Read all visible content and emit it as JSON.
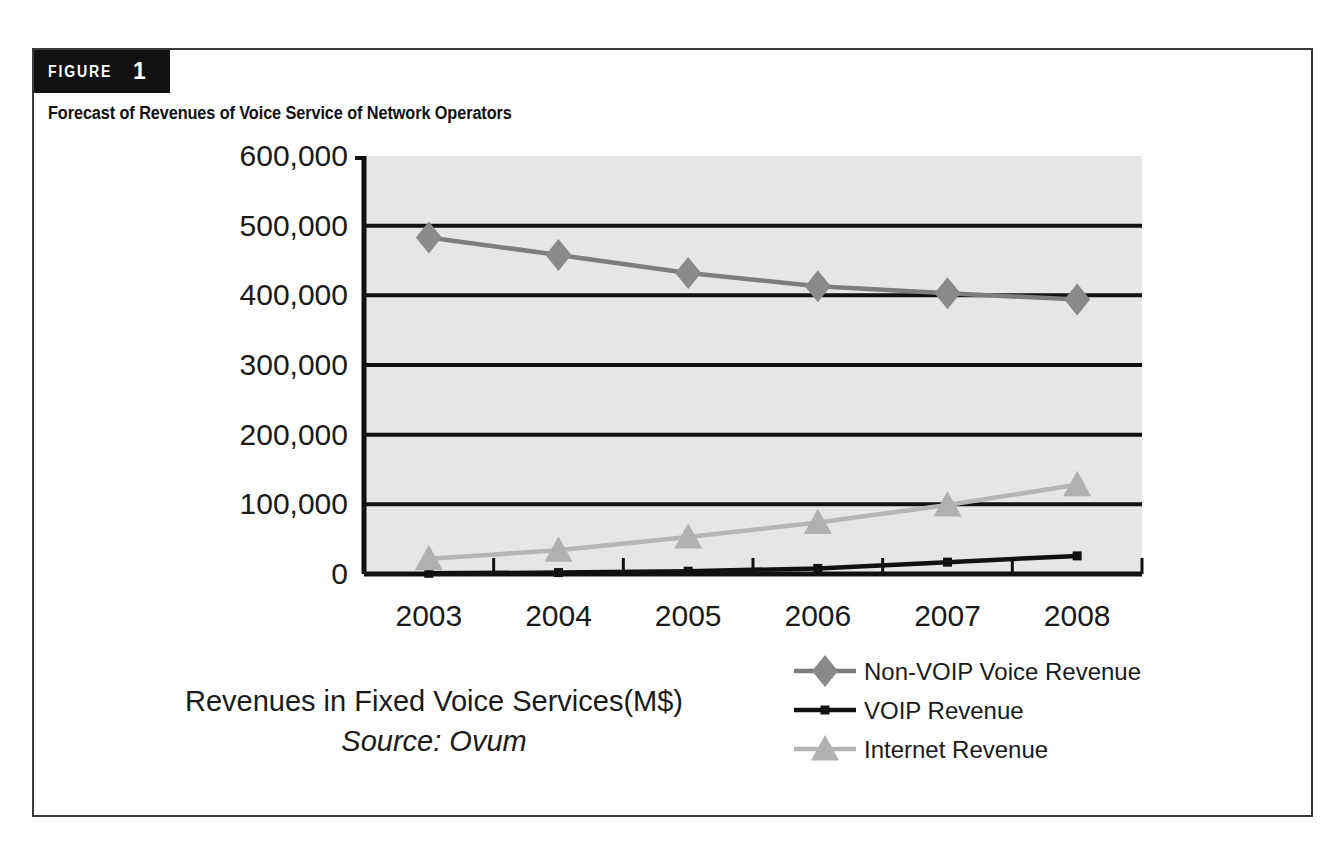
{
  "figure": {
    "badge_word": "FIGURE",
    "badge_number": "1",
    "title": "Forecast of Revenues of Voice Service of Network Operators"
  },
  "chart_data": {
    "type": "line",
    "title": "Forecast of Revenues of Voice Service of Network Operators",
    "xlabel": "Revenues in Fixed Voice Services(M$)",
    "ylabel": "",
    "source": "Source: Ovum",
    "categories": [
      "2003",
      "2004",
      "2005",
      "2006",
      "2007",
      "2008"
    ],
    "x": [
      2003,
      2004,
      2005,
      2006,
      2007,
      2008
    ],
    "ylim": [
      0,
      600000
    ],
    "ytick_labels": [
      "0",
      "100,000",
      "200,000",
      "300,000",
      "400,000",
      "500,000",
      "600,000"
    ],
    "ytick_values": [
      0,
      100000,
      200000,
      300000,
      400000,
      500000,
      600000
    ],
    "grid": "horizontal",
    "legend_position": "bottom-right",
    "plot_background": "#e6e6e6",
    "series": [
      {
        "name": "Non-VOIP Voice Revenue",
        "marker": "diamond",
        "color": "#8a8a8a",
        "line_color": "#7d7d7d",
        "values": [
          483000,
          458000,
          432000,
          413000,
          403000,
          394000
        ]
      },
      {
        "name": "VOIP Revenue",
        "marker": "square",
        "color": "#111111",
        "line_color": "#111111",
        "values": [
          1000,
          2000,
          4000,
          8000,
          17000,
          26000
        ]
      },
      {
        "name": "Internet Revenue",
        "marker": "triangle",
        "color": "#b0b0b0",
        "line_color": "#b5b5b5",
        "values": [
          22000,
          34000,
          53000,
          74000,
          99000,
          128000
        ]
      }
    ]
  }
}
